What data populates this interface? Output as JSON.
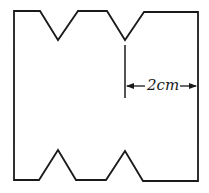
{
  "diagram": {
    "type": "paper-template with V-notches",
    "dimension_label": "2cm",
    "stroke_color": "#1a1a1a",
    "background": "#ffffff",
    "outline_points": [
      [
        14,
        11
      ],
      [
        40,
        11
      ],
      [
        58,
        40
      ],
      [
        78,
        11
      ],
      [
        107,
        11
      ],
      [
        125,
        40
      ],
      [
        144,
        12
      ],
      [
        198,
        12
      ],
      [
        198,
        181
      ],
      [
        143,
        181
      ],
      [
        125,
        151
      ],
      [
        106,
        180
      ],
      [
        76,
        180
      ],
      [
        58,
        150
      ],
      [
        39,
        180
      ],
      [
        14,
        180
      ]
    ],
    "top_notches": 2,
    "bottom_notches": 2,
    "dimension": {
      "from_x": 125,
      "to_x": 197,
      "y": 86,
      "text": "2cm"
    }
  }
}
